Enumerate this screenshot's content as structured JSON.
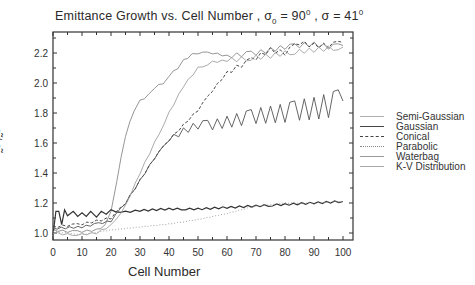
{
  "chart_data": {
    "type": "line",
    "title_parts": {
      "main": "Emittance Growth vs. Cell Number , σ",
      "sub": "0",
      "mid": " = 90",
      "sup1": "0",
      "mid2": " , σ = 41",
      "sup2": "0"
    },
    "xlabel": "Cell Number",
    "ylabel": "ε̃ / ε̃ᵢ",
    "xlim": [
      0,
      103
    ],
    "ylim": [
      0.95,
      2.35
    ],
    "xticks": [
      0,
      10,
      20,
      30,
      40,
      50,
      60,
      70,
      80,
      90,
      100
    ],
    "yticks": [
      1.0,
      1.2,
      1.4,
      1.6,
      1.8,
      2.0,
      2.2
    ],
    "ytick_labels": [
      "1.0",
      "1.2",
      "1.4",
      "1.6",
      "1.8",
      "2.0",
      "2.2"
    ],
    "grid": false,
    "legend_position": "right",
    "series": [
      {
        "name": "Semi-Gaussian",
        "style": "solid-light",
        "color": "#8a8a8a",
        "x": [
          0,
          5,
          10,
          15,
          18,
          20,
          22,
          25,
          28,
          30,
          33,
          35,
          38,
          40,
          43,
          45,
          48,
          50,
          55,
          60,
          65,
          70,
          75,
          80,
          85,
          90,
          95,
          100
        ],
        "y": [
          1.02,
          1.01,
          1.01,
          1.02,
          1.05,
          1.15,
          1.35,
          1.65,
          1.82,
          1.88,
          1.92,
          1.97,
          2.0,
          2.05,
          2.1,
          2.15,
          2.19,
          2.2,
          2.2,
          2.18,
          2.19,
          2.2,
          2.22,
          2.24,
          2.25,
          2.26,
          2.24,
          2.25
        ]
      },
      {
        "name": "Gaussian",
        "style": "solid",
        "color": "#333333",
        "x": [
          0,
          1,
          2,
          3,
          4,
          5,
          7,
          10,
          13,
          15,
          20,
          25,
          30,
          40,
          50,
          60,
          70,
          80,
          90,
          100
        ],
        "y": [
          1.0,
          1.13,
          1.13,
          1.07,
          1.14,
          1.1,
          1.13,
          1.12,
          1.13,
          1.12,
          1.15,
          1.14,
          1.15,
          1.16,
          1.16,
          1.17,
          1.18,
          1.19,
          1.2,
          1.21
        ]
      },
      {
        "name": "Conical",
        "style": "dashed",
        "color": "#333333",
        "x": [
          0,
          5,
          10,
          15,
          20,
          25,
          30,
          35,
          40,
          45,
          50,
          55,
          60,
          65,
          70,
          75,
          80,
          85,
          90,
          95,
          100
        ],
        "y": [
          1.04,
          1.05,
          1.06,
          1.08,
          1.1,
          1.2,
          1.35,
          1.5,
          1.62,
          1.72,
          1.82,
          1.95,
          2.07,
          2.12,
          2.17,
          2.22,
          2.2,
          2.27,
          2.25,
          2.25,
          2.27
        ]
      },
      {
        "name": "Parabolic",
        "style": "dotted",
        "color": "#999999",
        "x": [
          0,
          5,
          10,
          20,
          30,
          40,
          50,
          60,
          70,
          80,
          90,
          100
        ],
        "y": [
          1.01,
          1.0,
          0.99,
          1.02,
          1.04,
          1.06,
          1.09,
          1.13,
          1.18,
          1.2,
          1.2,
          1.21
        ]
      },
      {
        "name": "Waterbag",
        "style": "solid-light",
        "color": "#555555",
        "x": [
          0,
          10,
          20,
          25,
          30,
          35,
          40,
          45,
          50,
          55,
          60,
          65,
          70,
          75,
          80,
          85,
          90,
          95,
          100
        ],
        "y": [
          1.03,
          1.04,
          1.08,
          1.2,
          1.35,
          1.5,
          1.62,
          1.68,
          1.72,
          1.72,
          1.74,
          1.76,
          1.78,
          1.79,
          1.8,
          1.82,
          1.83,
          1.85,
          1.88
        ]
      },
      {
        "name": "K-V Distribution",
        "style": "solid-light",
        "color": "#a0a0a0",
        "x": [
          0,
          5,
          10,
          15,
          20,
          25,
          30,
          35,
          40,
          45,
          50,
          55,
          60,
          65,
          70,
          75,
          80,
          85,
          90,
          95,
          100
        ],
        "y": [
          1.0,
          0.99,
          0.99,
          1.0,
          1.05,
          1.18,
          1.4,
          1.6,
          1.8,
          1.98,
          2.1,
          2.14,
          2.15,
          2.16,
          2.17,
          2.18,
          2.2,
          2.21,
          2.22,
          2.23,
          2.24
        ]
      }
    ]
  },
  "legend": {
    "items": [
      {
        "label": "Semi-Gaussian",
        "color": "#b0b0b0",
        "dash": "solid"
      },
      {
        "label": "Gaussian",
        "color": "#444444",
        "dash": "solid"
      },
      {
        "label": "Conical",
        "color": "#444444",
        "dash": "dashed"
      },
      {
        "label": "Parabolic",
        "color": "#888888",
        "dash": "dotted"
      },
      {
        "label": "Waterbag",
        "color": "#999999",
        "dash": "solid"
      },
      {
        "label": "K-V Distribution",
        "color": "#a8a8a8",
        "dash": "solid"
      }
    ]
  }
}
